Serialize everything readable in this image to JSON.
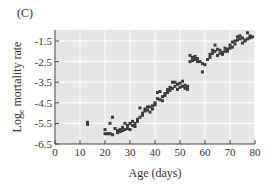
{
  "panel_label": "(C)",
  "colors": {
    "plot_bg": "#e6e6e6",
    "grid": "#ffffff",
    "point": "#3c3c3c",
    "axis": "#444444"
  },
  "chart_data": {
    "type": "scatter",
    "title": "",
    "panel": "(C)",
    "xlabel": "Age (days)",
    "ylabel": "Log_e mortality rate",
    "ylabel_parts": {
      "main_prefix": "Log",
      "subscript": "e",
      "main_suffix": " mortality rate"
    },
    "xlim": [
      0,
      80
    ],
    "ylim": [
      -6.5,
      -1.0
    ],
    "xticks": [
      0,
      10,
      20,
      30,
      40,
      50,
      60,
      70,
      80
    ],
    "yticks": [
      -6.5,
      -5.5,
      -4.5,
      -3.5,
      -2.5,
      -1.5
    ],
    "xtick_labels": [
      "0",
      "10",
      "20",
      "30",
      "40",
      "50",
      "60",
      "70",
      "80"
    ],
    "ytick_labels": [
      "-6.5",
      "-5.5",
      "-4.5",
      "-3.5",
      "-2.5",
      "-1.5"
    ],
    "grid": true,
    "legend": null,
    "points": [
      [
        13,
        -5.45
      ],
      [
        13,
        -5.55
      ],
      [
        20,
        -5.8
      ],
      [
        20,
        -6.0
      ],
      [
        21,
        -6.0
      ],
      [
        22,
        -6.0
      ],
      [
        22,
        -5.5
      ],
      [
        23,
        -6.05
      ],
      [
        23,
        -5.2
      ],
      [
        24,
        -5.75
      ],
      [
        25,
        -5.85
      ],
      [
        25,
        -5.95
      ],
      [
        26,
        -5.9
      ],
      [
        26,
        -5.8
      ],
      [
        27,
        -5.7
      ],
      [
        27,
        -5.85
      ],
      [
        28,
        -5.5
      ],
      [
        28,
        -5.8
      ],
      [
        29,
        -5.6
      ],
      [
        29,
        -5.75
      ],
      [
        30,
        -5.8
      ],
      [
        30,
        -5.5
      ],
      [
        31,
        -5.4
      ],
      [
        31,
        -5.6
      ],
      [
        32,
        -5.65
      ],
      [
        32,
        -5.5
      ],
      [
        33,
        -5.4
      ],
      [
        33,
        -5.3
      ],
      [
        34,
        -5.2
      ],
      [
        34,
        -4.75
      ],
      [
        35,
        -5.1
      ],
      [
        35,
        -5.0
      ],
      [
        36,
        -4.9
      ],
      [
        36,
        -4.8
      ],
      [
        37,
        -4.85
      ],
      [
        37,
        -4.7
      ],
      [
        38,
        -4.7
      ],
      [
        38,
        -4.95
      ],
      [
        39,
        -4.8
      ],
      [
        39,
        -4.65
      ],
      [
        40,
        -4.5
      ],
      [
        40,
        -4.6
      ],
      [
        41,
        -4.3
      ],
      [
        41,
        -4.0
      ],
      [
        42,
        -3.95
      ],
      [
        42,
        -4.35
      ],
      [
        43,
        -4.2
      ],
      [
        43,
        -4.4
      ],
      [
        44,
        -4.15
      ],
      [
        44,
        -4.05
      ],
      [
        45,
        -4.0
      ],
      [
        45,
        -3.85
      ],
      [
        46,
        -3.9
      ],
      [
        46,
        -3.75
      ],
      [
        47,
        -3.5
      ],
      [
        47,
        -3.8
      ],
      [
        48,
        -3.5
      ],
      [
        48,
        -3.7
      ],
      [
        49,
        -3.6
      ],
      [
        49,
        -3.85
      ],
      [
        50,
        -3.55
      ],
      [
        50,
        -3.75
      ],
      [
        51,
        -3.45
      ],
      [
        51,
        -3.7
      ],
      [
        52,
        -3.65
      ],
      [
        52,
        -3.8
      ],
      [
        53,
        -3.7
      ],
      [
        53,
        -3.85
      ],
      [
        54,
        -2.5
      ],
      [
        54,
        -2.2
      ],
      [
        55,
        -2.3
      ],
      [
        55,
        -2.45
      ],
      [
        56,
        -2.25
      ],
      [
        56,
        -2.4
      ],
      [
        57,
        -2.35
      ],
      [
        57,
        -2.5
      ],
      [
        58,
        -2.5
      ],
      [
        59,
        -2.6
      ],
      [
        59,
        -3.0
      ],
      [
        60,
        -2.65
      ],
      [
        61,
        -2.4
      ],
      [
        62,
        -2.3
      ],
      [
        62,
        -2.15
      ],
      [
        63,
        -2.1
      ],
      [
        63,
        -1.95
      ],
      [
        64,
        -1.7
      ],
      [
        64,
        -2.0
      ],
      [
        65,
        -1.9
      ],
      [
        65,
        -2.2
      ],
      [
        66,
        -2.1
      ],
      [
        66,
        -1.95
      ],
      [
        67,
        -2.05
      ],
      [
        67,
        -2.15
      ],
      [
        68,
        -2.0
      ],
      [
        68,
        -1.85
      ],
      [
        69,
        -1.9
      ],
      [
        69,
        -2.0
      ],
      [
        70,
        -1.85
      ],
      [
        70,
        -1.7
      ],
      [
        71,
        -1.55
      ],
      [
        71,
        -1.8
      ],
      [
        72,
        -1.5
      ],
      [
        72,
        -1.65
      ],
      [
        73,
        -1.3
      ],
      [
        73,
        -1.45
      ],
      [
        74,
        -1.25
      ],
      [
        74,
        -1.4
      ],
      [
        75,
        -1.35
      ],
      [
        75,
        -1.6
      ],
      [
        76,
        -1.5
      ],
      [
        76,
        -1.45
      ],
      [
        77,
        -1.1
      ],
      [
        77,
        -1.4
      ],
      [
        78,
        -1.35
      ],
      [
        78,
        -1.25
      ],
      [
        79,
        -1.3
      ]
    ]
  }
}
